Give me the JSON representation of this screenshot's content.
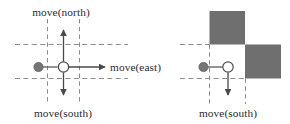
{
  "figure": {
    "name": "move-actions-diagram",
    "panel_count": 2,
    "colors": {
      "obstacle_fill": "#6f6f6f",
      "grid_dash": "#8c8c8c",
      "solid_line": "#5a5a5a",
      "agent_fill": "#757575",
      "target_fill": "#ffffff",
      "text": "#2b2b2b"
    },
    "left_panel": {
      "name": "unblocked-moves-panel",
      "labels": {
        "north": "move(north)",
        "east": "move(east)",
        "south": "move(south)"
      },
      "arrows": [
        "north",
        "east",
        "south"
      ],
      "agent_marker": "filled-circle",
      "target_marker": "open-circle",
      "obstacles": []
    },
    "right_panel": {
      "name": "blocked-moves-panel",
      "labels": {
        "south": "move(south)"
      },
      "arrows": [
        "south"
      ],
      "agent_marker": "filled-circle",
      "target_marker": "open-circle",
      "obstacles": [
        "upper-left-cell",
        "lower-right-cell"
      ]
    }
  }
}
